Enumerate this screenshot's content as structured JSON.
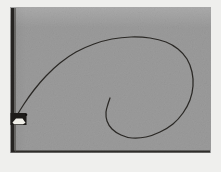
{
  "figure": {
    "caption": "",
    "background_color": "#9b9b9b",
    "page_color": "#efefed",
    "ink_color": "#23211f",
    "curve_color": "#2b2926"
  },
  "frame": {
    "wall_label": "vertical wall",
    "ground_label": "ground line",
    "wall_color": "#262422",
    "ground_color": "#2e2c29"
  },
  "block": {
    "label": "block",
    "body_color": "#1d1b19",
    "highlight_color": "#f0efe9"
  },
  "chart_data": {
    "type": "line",
    "title": "",
    "xlabel": "",
    "ylabel": "",
    "grid": false,
    "legend": null,
    "xlim": [
      0,
      221
    ],
    "ylim": [
      172,
      0
    ],
    "series": [
      {
        "name": "spiral-trajectory",
        "comment": "Involute / spiral path traced from the block at the wall, sweeping up and right, then curling clockwise inward and terminating in the interior.",
        "points": [
          [
            16,
            117
          ],
          [
            24,
            104
          ],
          [
            34,
            90
          ],
          [
            46,
            76
          ],
          [
            60,
            63
          ],
          [
            76,
            52
          ],
          [
            94,
            44
          ],
          [
            112,
            39
          ],
          [
            131,
            37
          ],
          [
            150,
            38
          ],
          [
            166,
            42
          ],
          [
            178,
            49
          ],
          [
            187,
            59
          ],
          [
            192,
            72
          ],
          [
            193,
            86
          ],
          [
            190,
            100
          ],
          [
            183,
            113
          ],
          [
            173,
            124
          ],
          [
            160,
            132
          ],
          [
            146,
            137
          ],
          [
            132,
            138
          ],
          [
            121,
            135
          ],
          [
            112,
            129
          ],
          [
            107,
            121
          ],
          [
            106,
            112
          ],
          [
            108,
            104
          ],
          [
            110,
            98
          ]
        ]
      }
    ],
    "markers": [
      {
        "name": "block-marker",
        "x": 17,
        "y": 119,
        "shape": "rectangle",
        "width": 16,
        "height": 12
      }
    ],
    "annotations": [
      {
        "name": "wall",
        "x1": 13,
        "y1": 8,
        "x2": 13,
        "y2": 152,
        "style": "thick-vertical-line"
      },
      {
        "name": "ground",
        "x1": 11,
        "y1": 151,
        "x2": 210,
        "y2": 151,
        "style": "horizontal-line"
      }
    ]
  }
}
